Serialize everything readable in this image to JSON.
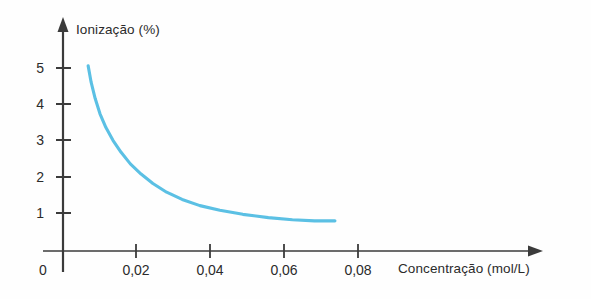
{
  "chart_data": {
    "type": "line",
    "title": "",
    "xlabel": "Concentração (mol/L)",
    "ylabel": "Ionização (%)",
    "xlim": [
      0,
      0.0925
    ],
    "ylim": [
      0,
      5.6
    ],
    "grid": false,
    "legend": null,
    "series": [
      {
        "name": "Ionização",
        "color": "#5bc0e4",
        "x": [
          0.0068,
          0.0076,
          0.0087,
          0.01,
          0.0116,
          0.0135,
          0.0157,
          0.0182,
          0.0211,
          0.0243,
          0.028,
          0.0322,
          0.037,
          0.0424,
          0.0486,
          0.0555,
          0.062,
          0.068,
          0.0735
        ],
        "y": [
          5.1,
          4.65,
          4.2,
          3.78,
          3.4,
          3.05,
          2.72,
          2.4,
          2.12,
          1.86,
          1.62,
          1.42,
          1.25,
          1.12,
          1.01,
          0.92,
          0.86,
          0.83,
          0.83
        ]
      }
    ],
    "x_ticks": [
      {
        "value": 0,
        "label": "0"
      },
      {
        "value": 0.02,
        "label": "0,02"
      },
      {
        "value": 0.04,
        "label": "0,04"
      },
      {
        "value": 0.06,
        "label": "0,06"
      },
      {
        "value": 0.08,
        "label": "0,08"
      }
    ],
    "y_ticks": [
      {
        "value": 1,
        "label": "1"
      },
      {
        "value": 2,
        "label": "2"
      },
      {
        "value": 3,
        "label": "3"
      },
      {
        "value": 4,
        "label": "4"
      },
      {
        "value": 5,
        "label": "5"
      }
    ]
  },
  "axes": {
    "y_title": "Ionização (%)",
    "x_title": "Concentração (mol/L)",
    "axis_color": "#3b3b3b",
    "curve_color": "#5bc0e4",
    "background": "#fefefe"
  },
  "y_tick_labels": {
    "t5": "5",
    "t4": "4",
    "t3": "3",
    "t2": "2",
    "t1": "1"
  },
  "x_tick_labels": {
    "t0": "0",
    "t002": "0,02",
    "t004": "0,04",
    "t006": "0,06",
    "t008": "0,08"
  }
}
